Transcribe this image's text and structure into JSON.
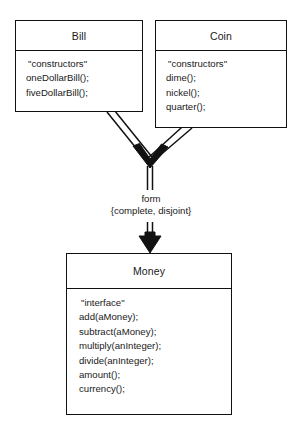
{
  "diagram": {
    "type": "uml-class-diagram",
    "background_color": "#ffffff",
    "line_color": "#111111",
    "text_color": "#1a1a1a",
    "classes": [
      {
        "id": "bill",
        "name": "Bill",
        "members": [
          "\"constructors\"",
          "oneDollarBill();",
          "fiveDollarBill();"
        ]
      },
      {
        "id": "coin",
        "name": "Coin",
        "members": [
          "\"constructors\"",
          "dime();",
          "nickel();",
          "quarter();"
        ]
      },
      {
        "id": "money",
        "name": "Money",
        "members": [
          "\"interface\"",
          "add(aMoney);",
          "subtract(aMoney);",
          "multiply(anInteger);",
          "divide(anInteger);",
          "amount();",
          "currency();"
        ]
      }
    ],
    "relationship": {
      "kind": "generalization",
      "role_label": "form",
      "constraint_label": "{complete, disjoint}",
      "sources": [
        "Bill",
        "Coin"
      ],
      "target": "Money"
    }
  }
}
